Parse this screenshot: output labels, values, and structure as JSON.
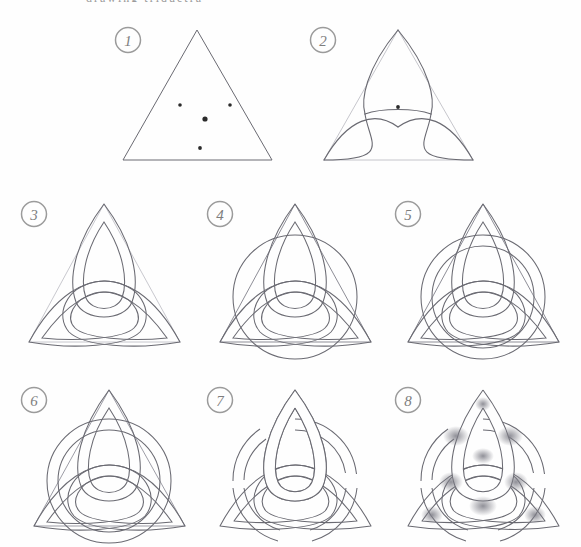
{
  "document": {
    "type": "hand-drawn-pencil-tutorial",
    "title": "How to draw a Celtic triquetra knot",
    "cut_off_header_text": "drawing triquetra",
    "background_color": "#fefefe",
    "ink_color": "#6a6a72",
    "faint_ink_color": "#b9b9c0",
    "badge_color": "#9b9b9b",
    "shade_color": "#8e8e96",
    "columns": 3,
    "rows": 3,
    "panel_count": 8
  },
  "steps": [
    {
      "number": "1",
      "badge_name": "step-badge-1",
      "caption": "Draw an equilateral triangle and mark the centre plus three guide points",
      "elements": [
        "triangle",
        "dot-left",
        "dot-right",
        "dot-center",
        "dot-bottom"
      ],
      "dots": [
        {
          "name": "dot-upper-left",
          "x": 72,
          "y": 83,
          "r": 1.8
        },
        {
          "name": "dot-upper-right",
          "x": 122,
          "y": 83,
          "r": 1.8
        },
        {
          "name": "dot-center",
          "x": 97,
          "y": 97,
          "r": 2.6
        },
        {
          "name": "dot-lower",
          "x": 92,
          "y": 126,
          "r": 1.9
        }
      ]
    },
    {
      "number": "2",
      "badge_name": "step-badge-2",
      "caption": "Sweep the first two arcs from the triangle corners",
      "elements": [
        "triangle-faint",
        "arc-top-lens",
        "arc-lower-lens",
        "dot-center"
      ]
    },
    {
      "number": "3",
      "badge_name": "step-badge-3",
      "caption": "Double each arc to give every loop a band width",
      "elements": [
        "triangle-faint",
        "lens-top-outer",
        "lens-top-inner",
        "lens-left-outer",
        "lens-left-inner",
        "lens-right-outer",
        "lens-right-inner"
      ]
    },
    {
      "number": "4",
      "badge_name": "step-badge-4",
      "caption": "Add the enclosing circle through the three loop crossings",
      "elements": [
        "triangle",
        "triquetra-lenses",
        "circle-outer"
      ]
    },
    {
      "number": "5",
      "badge_name": "step-badge-5",
      "caption": "Double the circle so it also becomes a band",
      "elements": [
        "triangle",
        "triquetra-lenses",
        "circle-outer",
        "circle-inner"
      ]
    },
    {
      "number": "6",
      "badge_name": "step-badge-6",
      "caption": "Check all the bands and crossings before erasing guides",
      "elements": [
        "triangle-faint",
        "triquetra-lenses",
        "circle-outer",
        "circle-inner"
      ]
    },
    {
      "number": "7",
      "badge_name": "step-badge-7",
      "caption": "Erase the guides and break the lines so the bands weave over and under",
      "elements": [
        "woven-triquetra-outline",
        "woven-circle-outline"
      ]
    },
    {
      "number": "8",
      "badge_name": "step-badge-8",
      "caption": "Shade the under-crossings to finish the knot",
      "elements": [
        "woven-triquetra-outline",
        "woven-circle-outline",
        "pencil-shading"
      ]
    }
  ]
}
